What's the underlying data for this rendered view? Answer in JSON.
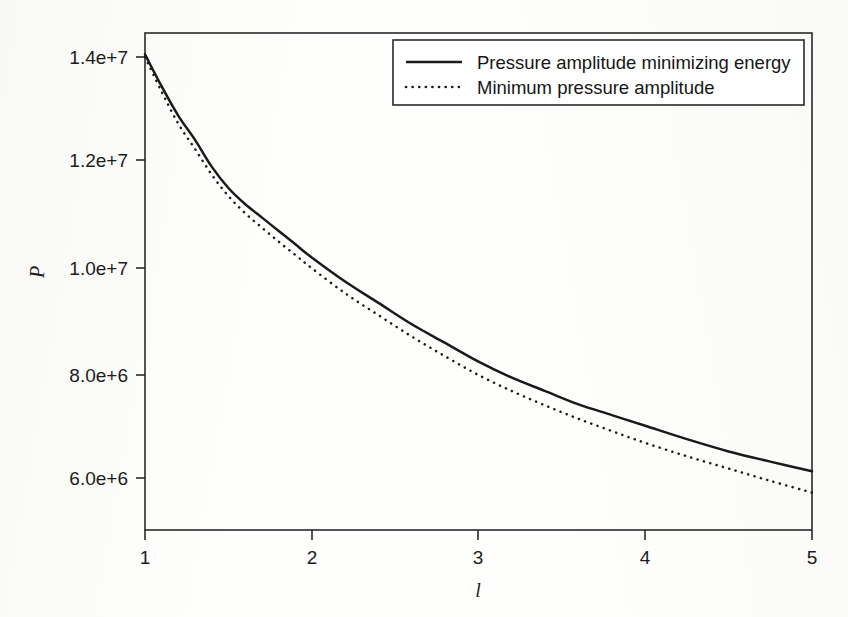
{
  "chart_data": {
    "type": "line",
    "title": "",
    "xlabel": "l",
    "ylabel": "P",
    "xlim": [
      1,
      5
    ],
    "ylim": [
      5100000,
      14400000
    ],
    "grid": false,
    "legend_position": "top-right",
    "x_ticks": [
      "1",
      "2",
      "3",
      "4",
      "5"
    ],
    "x_tick_values": [
      1,
      2,
      3,
      4,
      5
    ],
    "y_ticks": [
      "6.0e+6",
      "8.0e+6",
      "1.0e+7",
      "1.2e+7",
      "1.4e+7"
    ],
    "y_tick_values": [
      6000000,
      8000000,
      10000000,
      12000000,
      14000000
    ],
    "x": [
      1.0,
      1.1,
      1.2,
      1.3,
      1.4,
      1.5,
      1.6,
      1.7,
      1.8,
      1.9,
      2.0,
      2.2,
      2.4,
      2.6,
      2.8,
      3.0,
      3.2,
      3.4,
      3.6,
      3.8,
      4.0,
      4.25,
      4.5,
      4.75,
      5.0
    ],
    "series": [
      {
        "name": "Pressure amplitude minimizing energy",
        "style": "solid",
        "color": "#1a1a1a",
        "values": [
          14000000,
          13400000,
          12850000,
          12400000,
          11900000,
          11500000,
          11200000,
          10950000,
          10700000,
          10450000,
          10200000,
          9750000,
          9350000,
          8950000,
          8600000,
          8250000,
          7950000,
          7700000,
          7450000,
          7250000,
          7050000,
          6800000,
          6570000,
          6380000,
          6200000
        ]
      },
      {
        "name": "Minimum pressure amplitude",
        "style": "dotted",
        "color": "#1a1a1a",
        "values": [
          13950000,
          13300000,
          12700000,
          12230000,
          11750000,
          11350000,
          11030000,
          10760000,
          10500000,
          10250000,
          10000000,
          9530000,
          9120000,
          8720000,
          8350000,
          8000000,
          7700000,
          7430000,
          7180000,
          6950000,
          6730000,
          6480000,
          6250000,
          6020000,
          5800000
        ]
      }
    ],
    "legend": [
      {
        "label": "Pressure amplitude minimizing energy",
        "style": "solid"
      },
      {
        "label": "Minimum pressure amplitude",
        "style": "dotted"
      }
    ]
  },
  "geometry": {
    "plot_left": 145,
    "plot_right": 812,
    "plot_top": 33,
    "plot_bottom": 530
  }
}
